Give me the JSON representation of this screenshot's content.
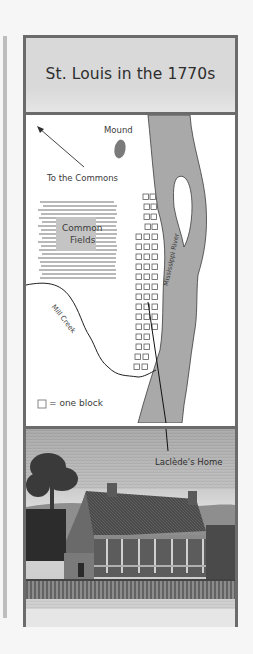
{
  "figure": {
    "title": "St. Louis in the 1770s",
    "map": {
      "labels": {
        "mound": "Mound",
        "to_commons": "To the Commons",
        "common_fields_line1": "Common",
        "common_fields_line2": "Fields",
        "river": "Mississippi River",
        "creek": "Mill Creek",
        "legend": "= one block"
      },
      "colors": {
        "river": "#a9a9a9",
        "mound": "#7a7a7a",
        "fields": "#b8b8b8",
        "frame": "#6b6b6b",
        "title_bg": "#d9d9d9"
      }
    },
    "illustration": {
      "callout": "Laclède's Home",
      "subject": "engraving of house with porch, chimneys, tree and picket fence"
    }
  }
}
